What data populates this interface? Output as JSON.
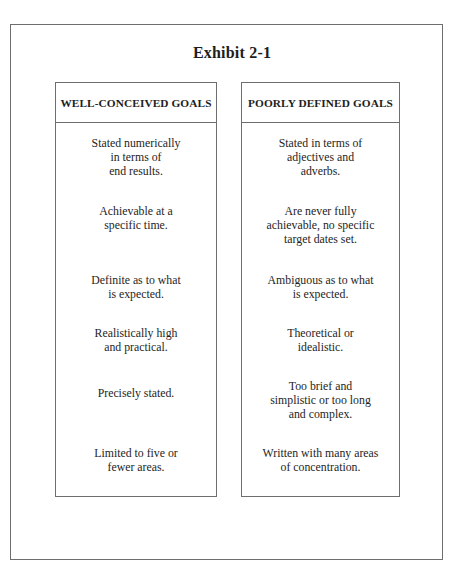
{
  "exhibit": {
    "title": "Exhibit 2-1"
  },
  "columns": [
    {
      "header": "WELL-CONCEIVED GOALS",
      "items": [
        [
          "Stated numerically",
          "in terms of",
          "end results."
        ],
        [
          "Achievable at a",
          "specific time."
        ],
        [
          "Definite as to what",
          "is expected."
        ],
        [
          "Realistically high",
          "and practical."
        ],
        [
          "Precisely stated."
        ],
        [
          "Limited to five or",
          "fewer areas."
        ]
      ]
    },
    {
      "header": "POORLY DEFINED GOALS",
      "items": [
        [
          "Stated in terms of",
          "adjectives and",
          "adverbs."
        ],
        [
          "Are never fully",
          "achievable, no specific",
          "target dates set."
        ],
        [
          "Ambiguous as to what",
          "is expected."
        ],
        [
          "Theoretical or",
          "idealistic."
        ],
        [
          "Too brief and",
          "simplistic or too long",
          "and complex."
        ],
        [
          "Written with many areas",
          "of concentration."
        ]
      ]
    }
  ]
}
